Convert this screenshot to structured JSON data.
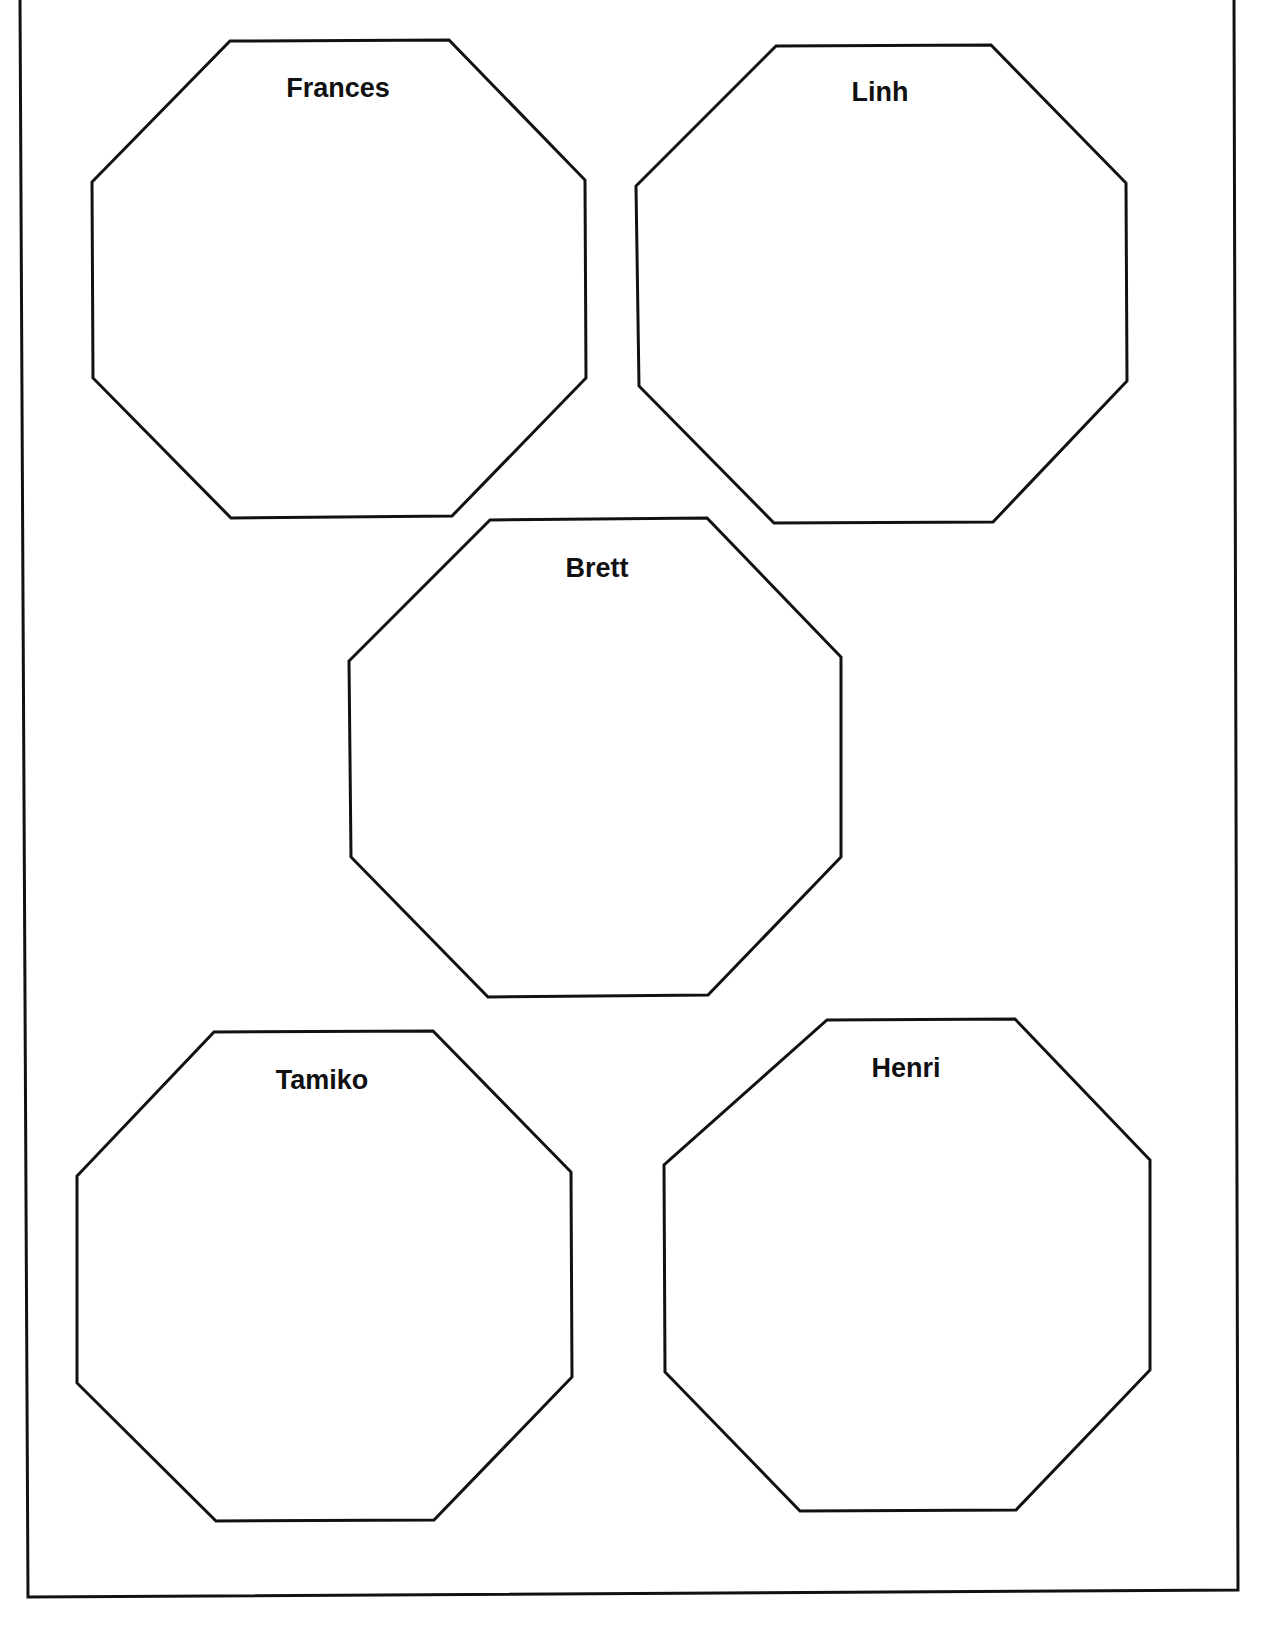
{
  "page": {
    "background": "#ffffff",
    "stroke_color": "#111111"
  },
  "frame": {
    "points": "20,0 28,1597 1238,1590 1234,0"
  },
  "octagons": [
    {
      "name": "Frances",
      "points": "230,41 449,40 585,180 586,378 452,516 231,518 93,378 92,182",
      "label_x": 338,
      "label_y": 75
    },
    {
      "name": "Linh",
      "points": "776,46 991,45 1126,183 1127,381 993,522 774,523 639,386 636,186",
      "label_x": 880,
      "label_y": 79
    },
    {
      "name": "Brett",
      "points": "490,520 707,518 841,657 841,857 708,995 488,997 351,857 349,661",
      "label_x": 597,
      "label_y": 555
    },
    {
      "name": "Tamiko",
      "points": "214,1032 433,1031 571,1172 572,1377 434,1520 216,1521 77,1383 77,1176",
      "label_x": 322,
      "label_y": 1067
    },
    {
      "name": "Henri",
      "points": "827,1020 1015,1019 1150,1160 1150,1370 1016,1510 800,1511 665,1372 664,1165",
      "label_x": 906,
      "label_y": 1055
    }
  ]
}
